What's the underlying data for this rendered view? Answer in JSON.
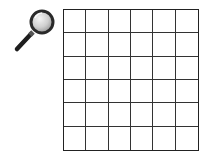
{
  "icon": {
    "name": "magnifying-glass",
    "colors": {
      "rim": "#2a2a2a",
      "lens": "#d9d9d9",
      "handle": "#1e1e1e"
    }
  },
  "grid": {
    "rows": 6,
    "cols": 6,
    "line_color": "#222222",
    "cell_color": "#ffffff"
  }
}
